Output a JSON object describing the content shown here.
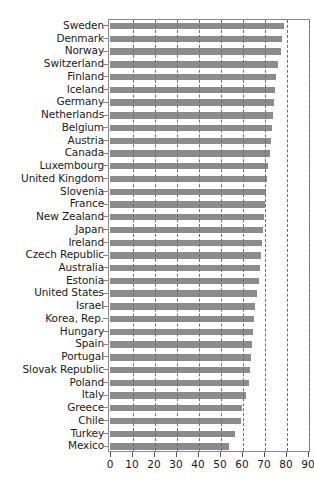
{
  "chart_data": {
    "type": "bar",
    "orientation": "horizontal",
    "title": "",
    "subtitle": "",
    "xlabel": "",
    "ylabel": "",
    "xlim": [
      0,
      90
    ],
    "ylim": null,
    "xticks": [
      0,
      10,
      20,
      30,
      40,
      50,
      60,
      70,
      80,
      90
    ],
    "xticklabels": [
      "0",
      "10",
      "20",
      "30",
      "40",
      "50",
      "60",
      "70",
      "80",
      "90"
    ],
    "grid": "vertical dashed gridlines at every x tick",
    "legend": null,
    "legend_position": "none",
    "bar_color": "#8c8c8c",
    "axis_color": "#8a8a8a",
    "categories": [
      "Sweden",
      "Denmark",
      "Norway",
      "Switzerland",
      "Finland",
      "Iceland",
      "Germany",
      "Netherlands",
      "Belgium",
      "Austria",
      "Canada",
      "Luxembourg",
      "United Kingdom",
      "Slovenia",
      "France",
      "New Zealand",
      "Japan",
      "Ireland",
      "Czech Republic",
      "Australia",
      "Estonia",
      "United States",
      "Israel",
      "Korea, Rep.",
      "Hungary",
      "Spain",
      "Portugal",
      "Slovak Republic",
      "Poland",
      "Italy",
      "Greece",
      "Chile",
      "Turkey",
      "Mexico"
    ],
    "values": [
      79.0,
      78.0,
      77.5,
      76.5,
      75.5,
      75.0,
      74.5,
      74.0,
      73.5,
      73.0,
      72.5,
      72.0,
      71.5,
      71.0,
      70.5,
      70.0,
      69.5,
      69.0,
      68.5,
      68.0,
      67.5,
      67.0,
      66.0,
      65.5,
      65.0,
      64.5,
      64.0,
      63.5,
      63.0,
      62.0,
      60.0,
      59.5,
      57.0,
      54.0
    ]
  }
}
